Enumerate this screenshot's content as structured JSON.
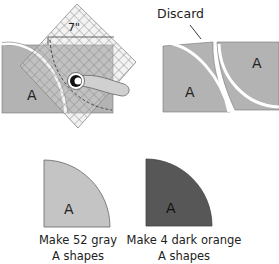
{
  "colors": {
    "fabric_gray": "#b3b3b3",
    "fabric_gray_light": "#c4c4c4",
    "dark_orange_shape": "#575757",
    "outline": "#666666",
    "ruler_grid": "#8a8a8a"
  },
  "step_cut": {
    "ruler_measure": "7\"",
    "shape_label": "A"
  },
  "step_discard": {
    "callout": "Discard",
    "left_piece_label": "A",
    "right_piece_label": "A"
  },
  "results": [
    {
      "shape_label": "A",
      "caption_line1": "Make 52 gray",
      "caption_line2": "A shapes",
      "color": "gray"
    },
    {
      "shape_label": "A",
      "caption_line1": "Make 4 dark orange",
      "caption_line2": "A shapes",
      "color": "dark orange"
    }
  ]
}
